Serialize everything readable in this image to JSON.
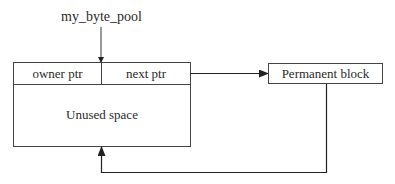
{
  "diagram": {
    "pool_label": "my_byte_pool",
    "main_block": {
      "owner_field": "owner ptr",
      "next_field": "next ptr",
      "body": "Unused space"
    },
    "permanent_block": "Permanent block",
    "line_color": "#333333"
  }
}
